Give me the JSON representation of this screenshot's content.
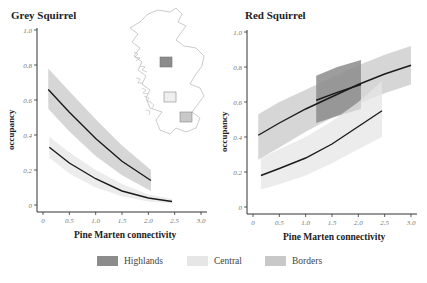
{
  "colors": {
    "highlands": "#8c8c8c",
    "central": "#e6e6e6",
    "borders": "#c8c8c8",
    "line": "#1a1a1a",
    "axis": "#333333",
    "map_outline": "#b5b5b5"
  },
  "legend": {
    "items": [
      {
        "label": "Highlands",
        "key": "highlands"
      },
      {
        "label": "Central",
        "key": "central"
      },
      {
        "label": "Borders",
        "key": "borders"
      }
    ]
  },
  "chart_data": [
    {
      "type": "line",
      "title": "Grey Squirrel",
      "xlabel": "Pine Marten connectivity",
      "ylabel": "occupancy",
      "xlim": [
        0,
        3.0
      ],
      "ylim": [
        0,
        1.0
      ],
      "xticks": [
        "0",
        "0.5",
        "1.0",
        "1.5",
        "2.0",
        "2.5",
        "3.0"
      ],
      "yticks": [
        "0",
        "0.2",
        "0.4",
        "0.6",
        "0.8",
        "1.0"
      ],
      "grid": false,
      "inset_map": true,
      "series": [
        {
          "name": "Borders",
          "x": [
            0.1,
            0.5,
            1.0,
            1.5,
            2.05
          ],
          "y": [
            0.66,
            0.53,
            0.38,
            0.25,
            0.14
          ],
          "upper": [
            0.78,
            0.65,
            0.49,
            0.34,
            0.2
          ],
          "lower": [
            0.55,
            0.42,
            0.28,
            0.17,
            0.08
          ]
        },
        {
          "name": "Central",
          "x": [
            0.12,
            0.5,
            1.0,
            1.5,
            2.0,
            2.45
          ],
          "y": [
            0.33,
            0.24,
            0.15,
            0.08,
            0.04,
            0.02
          ],
          "upper": [
            0.39,
            0.3,
            0.2,
            0.12,
            0.06,
            0.035
          ],
          "lower": [
            0.27,
            0.18,
            0.1,
            0.05,
            0.02,
            0.01
          ]
        }
      ]
    },
    {
      "type": "line",
      "title": "Red Squirrel",
      "xlabel": "Pine Marten connectivity",
      "ylabel": "occupancy",
      "xlim": [
        0,
        3.0
      ],
      "ylim": [
        0,
        1.0
      ],
      "xticks": [
        "0",
        "0.5",
        "1.0",
        "1.5",
        "2.0",
        "2.5",
        "3.0"
      ],
      "yticks": [
        "0",
        "0.2",
        "0.4",
        "0.6",
        "0.8",
        "1.0"
      ],
      "grid": false,
      "series": [
        {
          "name": "Borders",
          "x": [
            0.1,
            0.5,
            1.0,
            1.5,
            2.0,
            2.5,
            3.0
          ],
          "y": [
            0.41,
            0.48,
            0.56,
            0.63,
            0.7,
            0.76,
            0.81
          ],
          "upper": [
            0.53,
            0.6,
            0.67,
            0.74,
            0.81,
            0.87,
            0.92
          ],
          "lower": [
            0.27,
            0.34,
            0.43,
            0.51,
            0.59,
            0.65,
            0.7
          ]
        },
        {
          "name": "Highlands",
          "x": [
            1.2,
            1.6,
            2.05
          ],
          "y": [
            0.61,
            0.655,
            0.7
          ],
          "upper": [
            0.75,
            0.8,
            0.84
          ],
          "lower": [
            0.48,
            0.52,
            0.56
          ]
        },
        {
          "name": "Central",
          "x": [
            0.15,
            0.5,
            1.0,
            1.5,
            2.0,
            2.45
          ],
          "y": [
            0.18,
            0.22,
            0.28,
            0.36,
            0.46,
            0.55
          ],
          "upper": [
            0.28,
            0.33,
            0.4,
            0.49,
            0.6,
            0.72
          ],
          "lower": [
            0.1,
            0.13,
            0.18,
            0.25,
            0.33,
            0.4
          ]
        }
      ]
    }
  ]
}
